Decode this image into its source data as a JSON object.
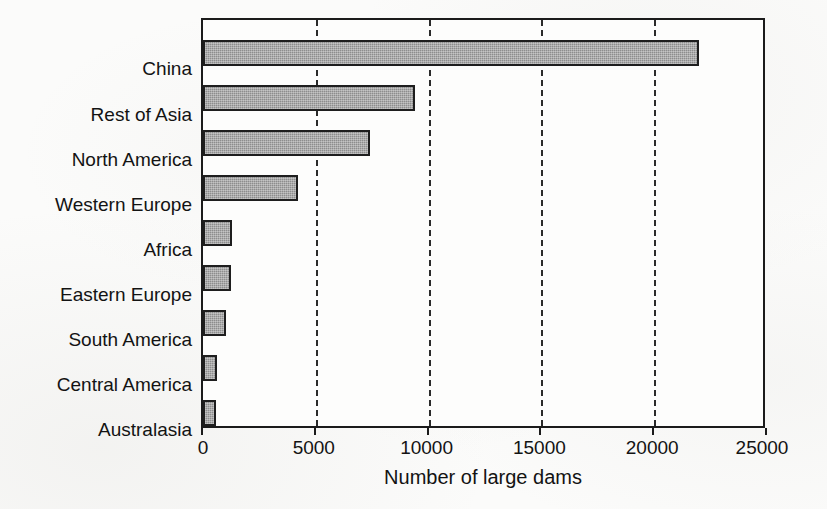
{
  "chart_data": {
    "type": "bar",
    "orientation": "horizontal",
    "title": "",
    "xlabel": "Number of large dams",
    "ylabel": "",
    "categories": [
      "China",
      "Rest of Asia",
      "North America",
      "Western Europe",
      "Africa",
      "Eastern Europe",
      "South America",
      "Central America",
      "Australasia"
    ],
    "values": [
      22000,
      9400,
      7400,
      4200,
      1300,
      1250,
      1000,
      600,
      560
    ],
    "xlim": [
      0,
      25000
    ],
    "xticks": [
      0,
      5000,
      10000,
      15000,
      20000,
      25000
    ],
    "xtick_labels": [
      "0",
      "5000",
      "10000",
      "15000",
      "20000",
      "25000"
    ],
    "grid": "vertical-dashed",
    "legend": "none",
    "bar_color": "#8d8d8d",
    "bar_edge_color": "#1e1e1e",
    "axis_color": "#1b1b1b",
    "background_color": "#fbfbfa"
  }
}
